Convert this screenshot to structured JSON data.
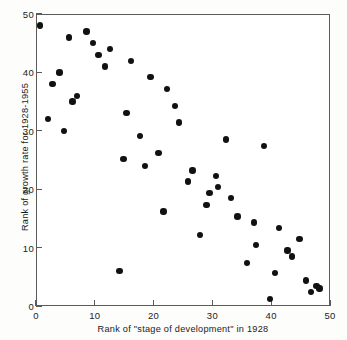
{
  "chart_data": {
    "type": "scatter",
    "title": "",
    "xlabel": "Rank of \"stage of development\" in 1928",
    "ylabel": "Rank of growth rate for 1928-1955",
    "xlim": [
      0,
      50
    ],
    "ylim": [
      0,
      50
    ],
    "xticks": [
      0,
      10,
      20,
      30,
      40,
      50
    ],
    "yticks": [
      0,
      10,
      20,
      30,
      40,
      50
    ],
    "xticklabels": [
      "0",
      "10",
      "20",
      "30",
      "40",
      "50"
    ],
    "yticklabels": [
      "0",
      "10",
      "20",
      "30",
      "40",
      "50"
    ],
    "grid": false,
    "legend": null,
    "marker": "filled-circle",
    "marker_color": "#111111",
    "frame_color": "#5b5b5b",
    "background_color": "#ffffff",
    "n_points": 49,
    "points": [
      {
        "x": 0.7,
        "y": 48.0
      },
      {
        "x": 2.0,
        "y": 32.0
      },
      {
        "x": 2.8,
        "y": 38.0
      },
      {
        "x": 4.0,
        "y": 40.0
      },
      {
        "x": 4.8,
        "y": 30.0
      },
      {
        "x": 5.6,
        "y": 46.0
      },
      {
        "x": 6.2,
        "y": 35.0
      },
      {
        "x": 7.0,
        "y": 36.0
      },
      {
        "x": 8.6,
        "y": 47.0
      },
      {
        "x": 9.7,
        "y": 45.0
      },
      {
        "x": 10.6,
        "y": 43.0
      },
      {
        "x": 11.7,
        "y": 41.0
      },
      {
        "x": 12.6,
        "y": 44.0
      },
      {
        "x": 14.2,
        "y": 6.0
      },
      {
        "x": 14.9,
        "y": 25.2
      },
      {
        "x": 15.4,
        "y": 33.0
      },
      {
        "x": 16.2,
        "y": 42.0
      },
      {
        "x": 17.7,
        "y": 29.1
      },
      {
        "x": 18.5,
        "y": 24.0
      },
      {
        "x": 19.5,
        "y": 39.2
      },
      {
        "x": 20.8,
        "y": 26.2
      },
      {
        "x": 21.7,
        "y": 16.2
      },
      {
        "x": 22.3,
        "y": 37.2
      },
      {
        "x": 23.6,
        "y": 34.2
      },
      {
        "x": 24.3,
        "y": 31.4
      },
      {
        "x": 25.8,
        "y": 21.3
      },
      {
        "x": 26.6,
        "y": 23.2
      },
      {
        "x": 27.9,
        "y": 12.2
      },
      {
        "x": 29.0,
        "y": 17.3
      },
      {
        "x": 29.5,
        "y": 19.4
      },
      {
        "x": 30.6,
        "y": 22.3
      },
      {
        "x": 31.0,
        "y": 20.4
      },
      {
        "x": 32.3,
        "y": 28.5
      },
      {
        "x": 33.2,
        "y": 18.5
      },
      {
        "x": 34.3,
        "y": 15.3
      },
      {
        "x": 35.9,
        "y": 7.4
      },
      {
        "x": 37.1,
        "y": 14.3
      },
      {
        "x": 37.4,
        "y": 10.4
      },
      {
        "x": 38.8,
        "y": 27.4
      },
      {
        "x": 39.8,
        "y": 1.2
      },
      {
        "x": 40.6,
        "y": 5.6
      },
      {
        "x": 41.3,
        "y": 13.4
      },
      {
        "x": 42.8,
        "y": 9.5
      },
      {
        "x": 43.5,
        "y": 8.5
      },
      {
        "x": 44.8,
        "y": 11.5
      },
      {
        "x": 45.9,
        "y": 4.4
      },
      {
        "x": 46.8,
        "y": 2.4
      },
      {
        "x": 47.7,
        "y": 3.4
      },
      {
        "x": 48.2,
        "y": 3.0
      }
    ]
  }
}
